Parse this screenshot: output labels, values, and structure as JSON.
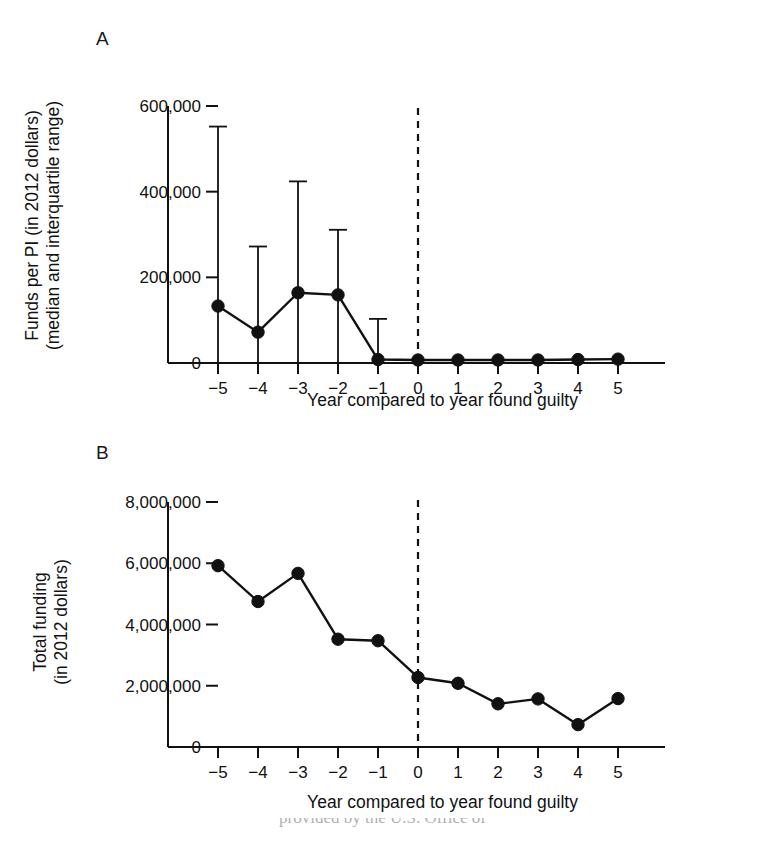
{
  "figure": {
    "background_color": "#ffffff",
    "ink_color": "#111111",
    "caption_fragment": "provided by the U.S. Office of"
  },
  "panel_a": {
    "letter": "A",
    "ylabel_line1": "Funds per PI (in 2012 dollars)",
    "ylabel_line2": "(median and interquartile range)",
    "xtitle": "Year compared to year found guilty",
    "yticks": [
      "0",
      "200,000",
      "400,000",
      "600,000"
    ],
    "xticks": [
      "−5",
      "−4",
      "−3",
      "−2",
      "−1",
      "0",
      "1",
      "2",
      "3",
      "4",
      "5"
    ],
    "reference_line_at": "0"
  },
  "panel_b": {
    "letter": "B",
    "ylabel_line1": "Total funding",
    "ylabel_line2": "(in 2012 dollars)",
    "xtitle": "Year compared to year found guilty",
    "yticks": [
      "0",
      "2,000,000",
      "4,000,000",
      "6,000,000",
      "8,000,000"
    ],
    "xticks": [
      "−5",
      "−4",
      "−3",
      "−2",
      "−1",
      "0",
      "1",
      "2",
      "3",
      "4",
      "5"
    ],
    "reference_line_at": "0"
  },
  "chart_data": [
    {
      "type": "line",
      "panel": "A",
      "title": "Funds per PI (in 2012 dollars)",
      "subtitle": "median and interquartile range",
      "xlabel": "Year compared to year found guilty",
      "ylabel": "Funds per PI (in 2012 dollars) (median and interquartile range)",
      "x": [
        -5,
        -4,
        -3,
        -2,
        -1,
        0,
        1,
        2,
        3,
        4,
        5
      ],
      "categories": [
        "-5",
        "-4",
        "-3",
        "-2",
        "-1",
        "0",
        "1",
        "2",
        "3",
        "4",
        "5"
      ],
      "values": [
        133000,
        72000,
        164000,
        159000,
        8000,
        7000,
        7000,
        7000,
        7000,
        8000,
        9000
      ],
      "error_upper": [
        552000,
        272000,
        424000,
        311000,
        103000,
        null,
        null,
        null,
        null,
        null,
        null
      ],
      "error_lower": [
        0,
        0,
        0,
        0,
        0,
        null,
        null,
        null,
        null,
        null,
        null
      ],
      "xlim": [
        -5.6,
        5.6
      ],
      "ylim": [
        0,
        600000
      ],
      "ytick_values": [
        0,
        200000,
        400000,
        600000
      ],
      "xtick_values": [
        -5,
        -4,
        -3,
        -2,
        -1,
        0,
        1,
        2,
        3,
        4,
        5
      ],
      "grid": false,
      "legend": false,
      "annotations": [
        {
          "type": "vertical-dashed-line",
          "x": 0,
          "label": "year found guilty"
        }
      ],
      "marker": "filled-circle",
      "error_bar_style": "upper-whisker-with-cap"
    },
    {
      "type": "line",
      "panel": "B",
      "title": "Total funding (in 2012 dollars)",
      "xlabel": "Year compared to year found guilty",
      "ylabel": "Total funding (in 2012 dollars)",
      "x": [
        -5,
        -4,
        -3,
        -2,
        -1,
        0,
        1,
        2,
        3,
        4,
        5
      ],
      "categories": [
        "-5",
        "-4",
        "-3",
        "-2",
        "-1",
        "0",
        "1",
        "2",
        "3",
        "4",
        "5"
      ],
      "values": [
        5920000,
        4750000,
        5670000,
        3520000,
        3470000,
        2270000,
        2080000,
        1410000,
        1570000,
        730000,
        1580000
      ],
      "xlim": [
        -5.6,
        5.6
      ],
      "ylim": [
        0,
        8000000
      ],
      "ytick_values": [
        0,
        2000000,
        4000000,
        6000000,
        8000000
      ],
      "xtick_values": [
        -5,
        -4,
        -3,
        -2,
        -1,
        0,
        1,
        2,
        3,
        4,
        5
      ],
      "grid": false,
      "legend": false,
      "annotations": [
        {
          "type": "vertical-dashed-line",
          "x": 0,
          "label": "year found guilty"
        }
      ],
      "marker": "filled-circle"
    }
  ]
}
